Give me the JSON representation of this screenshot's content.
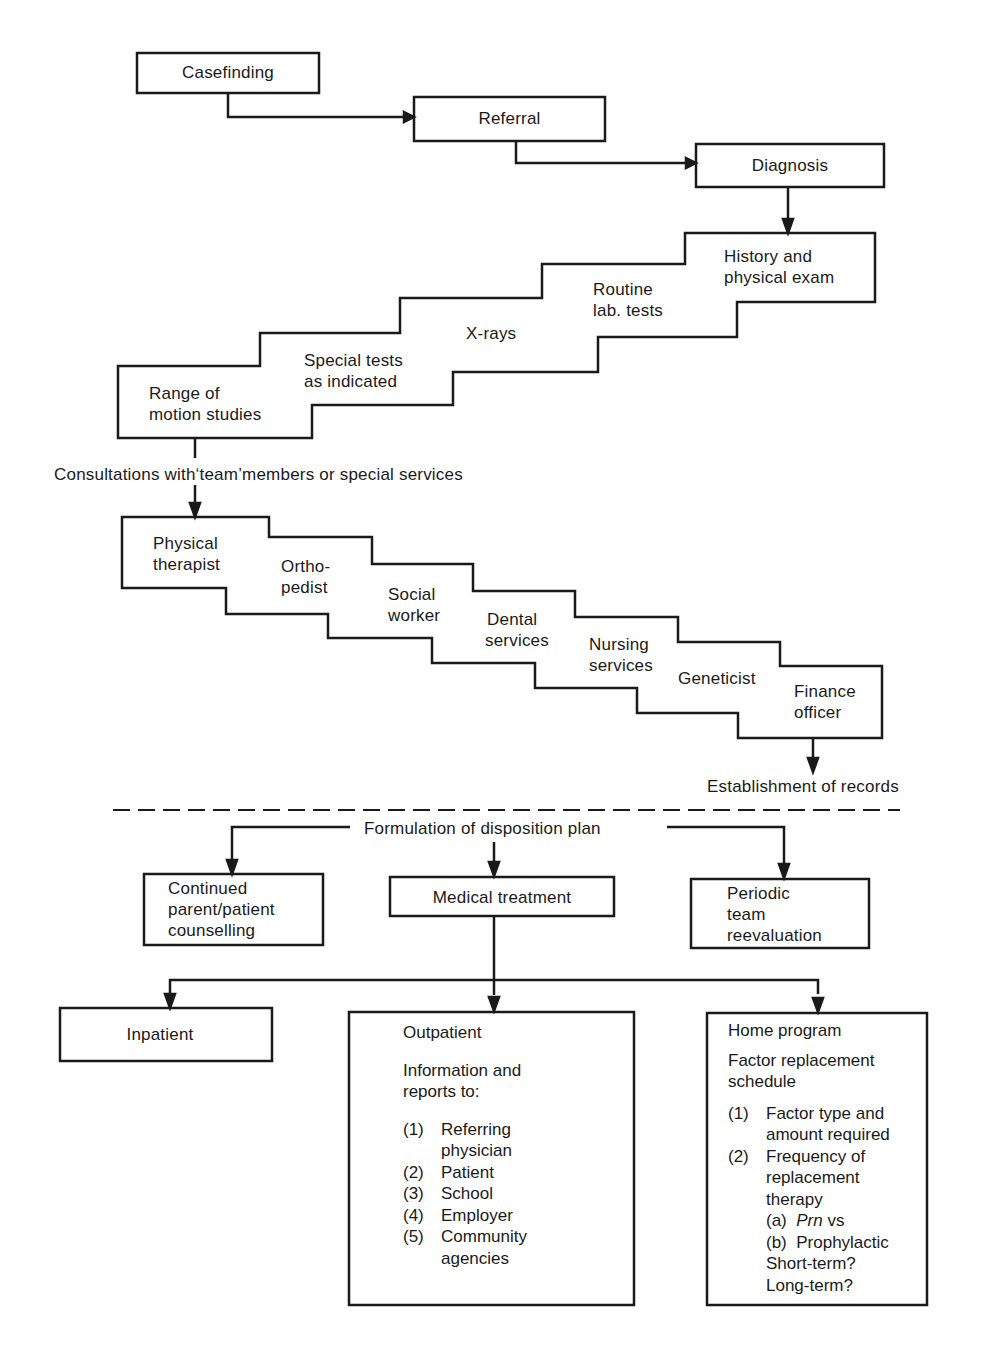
{
  "top_flow": {
    "casefinding": "Casefinding",
    "referral": "Referral",
    "diagnosis": "Diagnosis"
  },
  "diagnostic_steps": [
    {
      "line1": "Range of",
      "line2": "motion studies"
    },
    {
      "line1": "Special tests",
      "line2": "as indicated"
    },
    {
      "line1": "X-rays",
      "line2": ""
    },
    {
      "line1": "Routine",
      "line2": "lab. tests"
    },
    {
      "line1": "History and",
      "line2": "physical exam"
    }
  ],
  "consultations_label": "Consultations with‘team’members or special services",
  "consultation_steps": [
    {
      "line1": "Physical",
      "line2": "therapist"
    },
    {
      "line1": "Ortho-",
      "line2": "pedist"
    },
    {
      "line1": "Social",
      "line2": "worker"
    },
    {
      "line1": "Dental",
      "line2": "services"
    },
    {
      "line1": "Nursing",
      "line2": "services"
    },
    {
      "line1": "Geneticist",
      "line2": ""
    },
    {
      "line1": "Finance",
      "line2": "officer"
    }
  ],
  "records_label": "Establishment of records",
  "disposition": {
    "label": "Formulation of disposition plan",
    "counselling": {
      "line1": "Continued",
      "line2": "parent/patient",
      "line3": "counselling"
    },
    "medical_treatment": "Medical treatment",
    "reevaluation": {
      "line1": "Periodic",
      "line2": "team",
      "line3": "reevaluation"
    }
  },
  "treatment": {
    "inpatient": "Inpatient",
    "outpatient": {
      "title": "Outpatient",
      "intro1": "Information and",
      "intro2": "reports to:",
      "items": [
        {
          "num": "(1)",
          "line1": "Referring",
          "line2": "physician"
        },
        {
          "num": "(2)",
          "line1": "Patient"
        },
        {
          "num": "(3)",
          "line1": "School"
        },
        {
          "num": "(4)",
          "line1": "Employer"
        },
        {
          "num": "(5)",
          "line1": "Community",
          "line2": "agencies"
        }
      ]
    },
    "home_program": {
      "title": "Home program",
      "intro1": "Factor replacement",
      "intro2": "schedule",
      "item1_num": "(1)",
      "item1_line1": "Factor type and",
      "item1_line2": "amount required",
      "item2_num": "(2)",
      "item2_line1": "Frequency of",
      "item2_line2": "replacement",
      "item2_line3": "therapy",
      "sub_a_label": "(a)",
      "sub_a_italic": "Prn",
      "sub_a_rest": "vs",
      "sub_b": "(b)  Prophylactic",
      "short_term": "Short-term?",
      "long_term": "Long-term?"
    }
  }
}
